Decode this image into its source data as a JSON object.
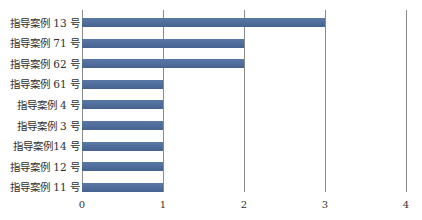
{
  "chart_data": {
    "type": "bar",
    "orientation": "horizontal",
    "title": "",
    "xlabel": "",
    "ylabel": "",
    "categories": [
      "指导案例 13 号",
      "指导案例 71 号",
      "指导案例 62 号",
      "指导案例 61 号",
      "指导案例 4 号",
      "指导案例 3 号",
      "指导案例14 号",
      "指导案例 12 号",
      "指导案例 11 号"
    ],
    "values": [
      3,
      2,
      2,
      1,
      1,
      1,
      1,
      1,
      1
    ],
    "xlim": [
      0,
      4
    ],
    "x_ticks": [
      "0",
      "1",
      "2",
      "3",
      "4"
    ],
    "grid": "vertical",
    "legend": "none",
    "bar_color": "#4f6d9c"
  }
}
